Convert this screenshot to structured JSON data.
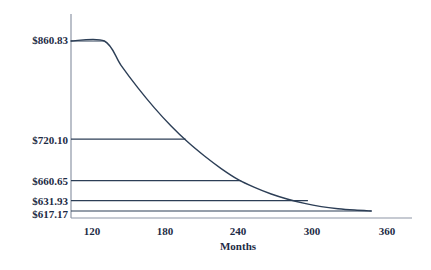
{
  "chart_data": {
    "type": "line",
    "title": "",
    "subtitle": "",
    "xlabel": "Months",
    "ylabel": "",
    "xlim": [
      90,
      375
    ],
    "ylim": [
      600,
      880
    ],
    "grid": false,
    "legend": null,
    "xticks": [
      120,
      180,
      240,
      300,
      360
    ],
    "xtick_labels": [
      "120",
      "180",
      "240",
      "300",
      "360"
    ],
    "yticks": [
      860.83,
      720.1,
      660.65,
      631.93,
      617.17
    ],
    "ytick_labels": [
      "$860.83",
      "$720.10",
      "$660.65",
      "$631.93",
      "$617.17"
    ],
    "series": [
      {
        "name": "Monthly payment",
        "x": [
          90,
          120,
          135,
          150,
          165,
          180,
          195,
          210,
          225,
          240,
          255,
          270,
          285,
          300,
          315,
          330,
          345,
          360
        ],
        "values": [
          860.83,
          860.83,
          826.0,
          794.0,
          765.0,
          739.0,
          716.0,
          696.0,
          678.0,
          662.5,
          651.0,
          641.5,
          634.0,
          628.0,
          623.5,
          620.5,
          618.5,
          617.17
        ]
      }
    ],
    "reference_lines": [
      {
        "label": "$860.83",
        "value": 860.83,
        "x_end": 120
      },
      {
        "label": "$720.10",
        "value": 720.1,
        "x_end": 193
      },
      {
        "label": "$660.65",
        "value": 660.65,
        "x_end": 243
      },
      {
        "label": "$631.93",
        "value": 631.93,
        "x_end": 303
      },
      {
        "label": "$617.17",
        "value": 617.17,
        "x_end": 360
      }
    ],
    "colors": {
      "line": "#2c3e56",
      "axis": "#8e96a6",
      "text": "#1d2b45",
      "background": "#ffffff"
    }
  }
}
